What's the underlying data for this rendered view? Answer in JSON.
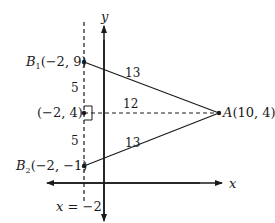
{
  "diagram": {
    "axes": {
      "x_label": "x",
      "y_label": "y"
    },
    "line_label": "x = −2",
    "points": {
      "A": {
        "name": "A",
        "coords": "(10, 4)"
      },
      "B1": {
        "name": "B",
        "sub": "1",
        "coords": "(−2, 9)"
      },
      "B2": {
        "name": "B",
        "sub": "2",
        "coords": "(−2, −1)"
      },
      "M": {
        "coords": "(−2, 4)"
      }
    },
    "segment_labels": {
      "AB1": "13",
      "AB2": "13",
      "AM": "12",
      "B1M": "5",
      "MB2": "5"
    }
  }
}
